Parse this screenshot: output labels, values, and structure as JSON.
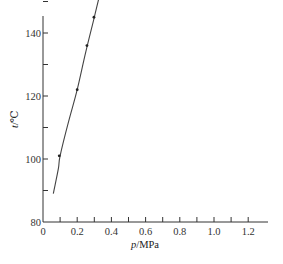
{
  "chart_data": {
    "type": "line",
    "title": "",
    "xlabel": "p/MPa",
    "ylabel": "t/℃",
    "xlim": [
      0,
      1.3
    ],
    "ylim": [
      80,
      210
    ],
    "grid": false,
    "legend": null,
    "xticks": [
      0,
      0.1,
      0.2,
      0.3,
      0.4,
      0.5,
      0.6,
      0.7,
      0.8,
      0.9,
      1.0,
      1.1,
      1.2
    ],
    "xtick_labels": [
      "0",
      "0.2",
      "0.4",
      "0.6",
      "0.8",
      "1.0",
      "1.2"
    ],
    "xtick_label_values": [
      0,
      0.2,
      0.4,
      0.6,
      0.8,
      1.0,
      1.2
    ],
    "yticks": [
      80,
      90,
      100,
      110,
      120,
      130,
      140,
      150,
      160,
      170,
      180,
      190,
      200
    ],
    "ytick_labels": [
      "80",
      "100",
      "120",
      "140",
      "160",
      "180",
      "200"
    ],
    "ytick_label_values": [
      80,
      100,
      120,
      140,
      160,
      180,
      200
    ],
    "series": [
      {
        "name": "saturation curve",
        "curve": {
          "x": [
            0.06,
            0.09,
            0.1,
            0.15,
            0.2,
            0.25,
            0.3,
            0.35,
            0.4,
            0.45,
            0.5,
            0.6,
            0.7,
            0.8,
            0.9,
            0.99
          ],
          "y": [
            89,
            97,
            101,
            112,
            122,
            134,
            145,
            156,
            165,
            173,
            180,
            189,
            197,
            202,
            206,
            208
          ]
        },
        "markers": {
          "x": [
            0.095,
            0.2,
            0.257,
            0.298,
            0.39,
            0.5,
            0.6
          ],
          "y": [
            101,
            122,
            136,
            145,
            165,
            180,
            189
          ]
        }
      }
    ]
  }
}
